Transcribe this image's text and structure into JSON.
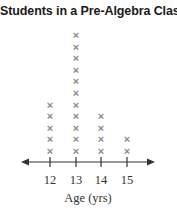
{
  "chart_data": {
    "type": "dot_plot",
    "title": "Students in a Pre-Algebra Class",
    "xlabel": "Age (yrs)",
    "ylabel": "",
    "marker": "x",
    "categories": [
      "12",
      "13",
      "14",
      "15"
    ],
    "values": [
      5,
      11,
      4,
      2
    ],
    "x_range": [
      12,
      15
    ],
    "axis_arrows": "both",
    "grid": false,
    "legend": null
  },
  "colors": {
    "marker": "#8a8a8a",
    "axis": "#333333",
    "title": "#1a1a1a"
  }
}
